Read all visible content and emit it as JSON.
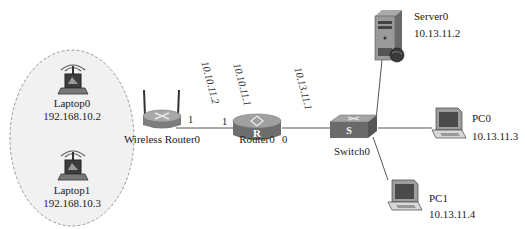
{
  "diagram": {
    "type": "network-topology",
    "wireless_zone": {
      "shape": "dashed-ellipse",
      "members": [
        "Laptop0",
        "Laptop1"
      ]
    },
    "devices": [
      {
        "id": "laptop0",
        "name": "Laptop0",
        "ip": "192.168.10.2",
        "icon": "wireless-laptop-icon"
      },
      {
        "id": "laptop1",
        "name": "Laptop1",
        "ip": "192.168.10.3",
        "icon": "wireless-laptop-icon"
      },
      {
        "id": "wrouter0",
        "name": "Wireless Router0",
        "icon": "wireless-router-icon"
      },
      {
        "id": "router0",
        "name": "Router0",
        "icon": "router-icon",
        "badge": "R"
      },
      {
        "id": "switch0",
        "name": "Switch0",
        "icon": "switch-icon",
        "badge": "S"
      },
      {
        "id": "server0",
        "name": "Server0",
        "ip": "10.13.11.2",
        "icon": "server-icon"
      },
      {
        "id": "pc0",
        "name": "PC0",
        "ip": "10.13.11.3",
        "icon": "pc-icon"
      },
      {
        "id": "pc1",
        "name": "PC1",
        "ip": "10.13.11.4",
        "icon": "pc-icon"
      }
    ],
    "interface_ips": {
      "wrouter0_wan": "10.10.11.2",
      "router0_if1": "10.10.11.1",
      "router0_if0": "10.13.11.1"
    },
    "ports": {
      "wrouter0_port": "1",
      "router0_left_port": "1",
      "router0_right_port": "0"
    },
    "links": [
      {
        "from": "Wireless Router0",
        "to": "Router0"
      },
      {
        "from": "Router0",
        "to": "Switch0"
      },
      {
        "from": "Switch0",
        "to": "Server0"
      },
      {
        "from": "Switch0",
        "to": "PC0"
      },
      {
        "from": "Switch0",
        "to": "PC1"
      }
    ]
  }
}
